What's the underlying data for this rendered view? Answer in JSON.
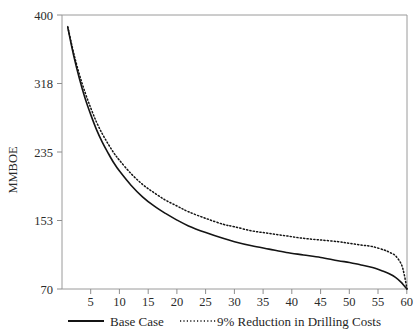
{
  "chart_data": {
    "type": "line",
    "title": "",
    "subtitle": "",
    "xlabel": "",
    "ylabel": "MMBOE",
    "xlim": [
      0,
      60
    ],
    "ylim": [
      70,
      400
    ],
    "grid": false,
    "legend_position": "bottom",
    "x_ticks": [
      5,
      10,
      15,
      20,
      25,
      30,
      35,
      40,
      45,
      50,
      55,
      60
    ],
    "x_tick_labels": [
      "5",
      "10",
      "15",
      "20",
      "25",
      "30",
      "35",
      "40",
      "45",
      "50",
      "55",
      "60"
    ],
    "y_ticks": [
      70,
      153,
      235,
      318,
      400
    ],
    "y_tick_labels": [
      "70",
      "153",
      "235",
      "318",
      "400"
    ],
    "x": [
      1,
      2,
      3,
      4,
      5,
      6,
      7,
      8,
      9,
      10,
      12,
      14,
      16,
      18,
      20,
      22,
      25,
      28,
      30,
      33,
      36,
      39,
      42,
      45,
      48,
      50,
      52,
      54,
      56,
      57,
      58,
      59,
      59.5,
      60
    ],
    "series": [
      {
        "name": "Base Case",
        "style": "solid",
        "color": "#141414",
        "values": [
          385,
          352,
          324,
          300,
          280,
          262,
          247,
          234,
          222,
          212,
          195,
          181,
          170,
          161,
          153,
          146,
          138,
          131,
          127,
          122,
          118,
          114,
          111,
          108,
          104,
          102,
          99,
          96,
          91,
          88,
          84,
          78,
          74,
          70
        ]
      },
      {
        "name": "9% Reduction in Drilling Costs",
        "style": "dotted",
        "color": "#141414",
        "values": [
          386,
          355,
          329,
          307,
          288,
          271,
          257,
          245,
          234,
          225,
          209,
          196,
          186,
          177,
          170,
          163,
          155,
          148,
          145,
          140,
          137,
          134,
          131,
          129,
          127,
          125,
          123,
          121,
          117,
          114,
          110,
          100,
          88,
          70
        ]
      }
    ],
    "legend": [
      {
        "label": "Base Case",
        "style": "solid"
      },
      {
        "label": "9% Reduction in Drilling Costs",
        "style": "dotted"
      }
    ]
  }
}
